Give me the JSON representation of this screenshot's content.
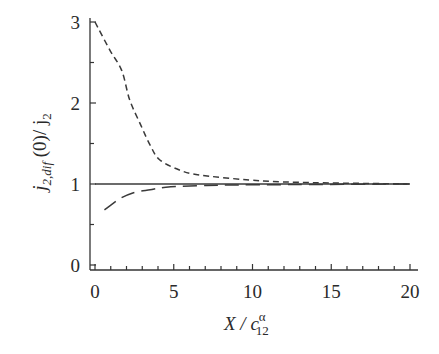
{
  "chart_data": {
    "type": "line",
    "title": "",
    "xlabel": "X / c12^α",
    "xlabel_parts": {
      "main": "X / c",
      "sup": "α",
      "sub": "12"
    },
    "ylabel": "j2,dif(0)/ j2",
    "ylabel_parts": {
      "j": "j",
      "sub": "2,dif",
      "rest": " (0)/ j",
      "sub2": "2"
    },
    "xlim": [
      0,
      20
    ],
    "ylim": [
      0,
      3
    ],
    "x_ticks": [
      "0",
      "5",
      "10",
      "15",
      "20"
    ],
    "y_ticks": [
      "0",
      "1",
      "2",
      "3"
    ],
    "grid": false,
    "legend": null,
    "series": [
      {
        "name": "reference (solid)",
        "style": "solid",
        "x": [
          0,
          20
        ],
        "y": [
          1.0,
          1.0
        ]
      },
      {
        "name": "short-dashed",
        "style": "short-dash",
        "x": [
          0,
          0.95,
          1.7,
          2.2,
          2.9,
          3.5,
          4.1,
          5.4,
          6.7,
          9.8,
          13,
          20
        ],
        "y": [
          3.0,
          2.65,
          2.4,
          2.04,
          1.73,
          1.48,
          1.3,
          1.17,
          1.11,
          1.05,
          1.02,
          1.0
        ]
      },
      {
        "name": "long-dashed",
        "style": "long-dash",
        "x": [
          0.6,
          1.5,
          2.4,
          3.5,
          4.5,
          6.5,
          10,
          20
        ],
        "y": [
          0.68,
          0.81,
          0.89,
          0.93,
          0.96,
          0.98,
          0.99,
          1.0
        ]
      }
    ]
  }
}
